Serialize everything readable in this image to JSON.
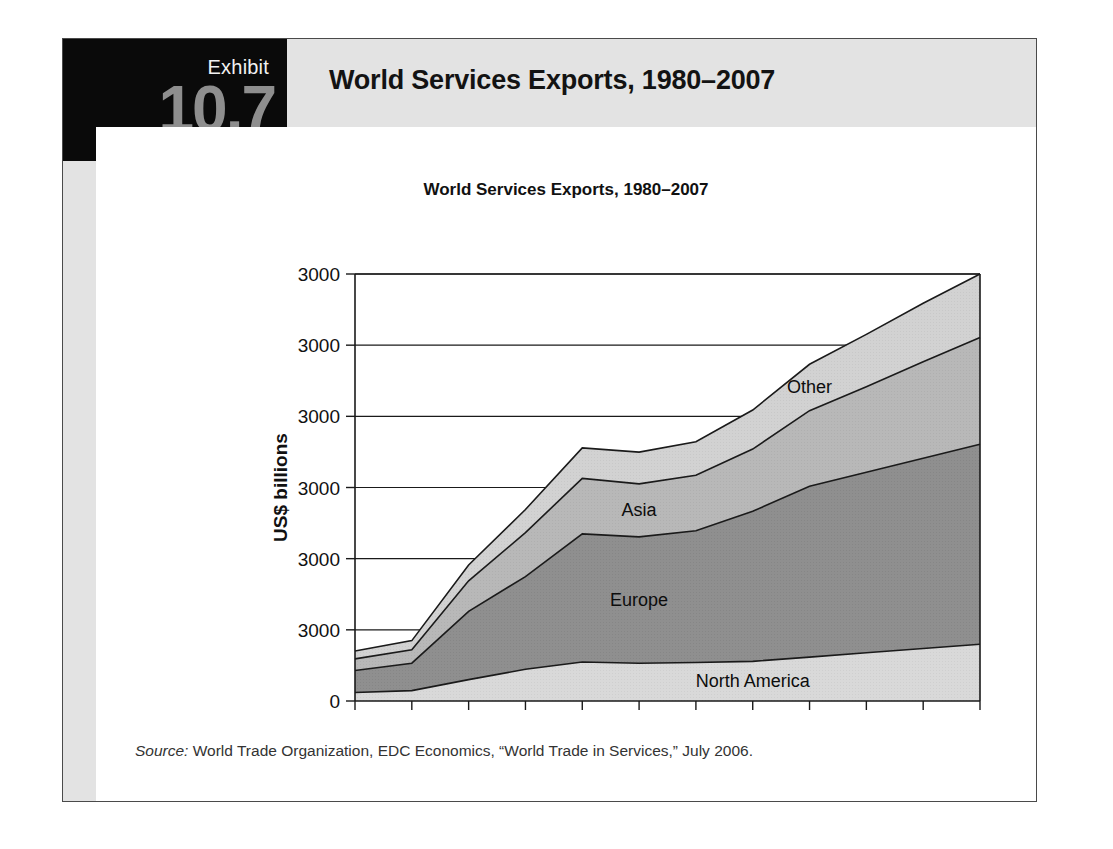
{
  "exhibit": {
    "label": "Exhibit",
    "number": "10.7",
    "title": "World Services Exports, 1980–2007"
  },
  "source": {
    "label": "Source:",
    "text": " World Trade Organization, EDC Economics, “World Trade in Services,” July 2006."
  },
  "colors": {
    "tab_background": "#0a0a0a",
    "header_band": "#e3e3e3",
    "exhibit_number": "#8e8e8e",
    "north_america": "#d9d9d9",
    "europe": "#8f8f8f",
    "asia": "#b8b8b8",
    "other": "#d2d2d2",
    "outline": "#1a1a1a"
  },
  "chart_data": {
    "type": "area",
    "title": "World Services Exports, 1980–2007",
    "xlabel": "",
    "ylabel": "US$ billions",
    "stacked": true,
    "grid": true,
    "legend": "inline-labels",
    "categories": [
      "1980",
      "1985",
      "1990",
      "1995",
      "2000",
      "2001",
      "2002",
      "2003",
      "2004",
      "2005",
      "2006",
      "2007"
    ],
    "ytick_labels": [
      "3000",
      "3000",
      "3000",
      "3000",
      "3000",
      "3000",
      "0"
    ],
    "ylim": [
      0,
      3500
    ],
    "series": [
      {
        "name": "North America",
        "values": [
          70,
          85,
          175,
          260,
          320,
          310,
          315,
          325,
          360,
          395,
          430,
          465
        ]
      },
      {
        "name": "Europe",
        "values": [
          180,
          225,
          560,
          760,
          1050,
          1035,
          1080,
          1230,
          1400,
          1480,
          1560,
          1640
        ]
      },
      {
        "name": "Asia",
        "values": [
          95,
          110,
          250,
          360,
          455,
          435,
          455,
          510,
          620,
          700,
          790,
          875
        ]
      },
      {
        "name": "Other",
        "values": [
          65,
          75,
          130,
          190,
          250,
          260,
          275,
          320,
          380,
          430,
          480,
          520
        ]
      }
    ],
    "series_label_positions": [
      {
        "name": "North America",
        "x_index": 7,
        "note": "inside bottom band"
      },
      {
        "name": "Europe",
        "x_index": 5,
        "note": "inside second band"
      },
      {
        "name": "Asia",
        "x_index": 5,
        "note": "inside third band"
      },
      {
        "name": "Other",
        "x_index": 8,
        "note": "inside top band"
      }
    ]
  }
}
